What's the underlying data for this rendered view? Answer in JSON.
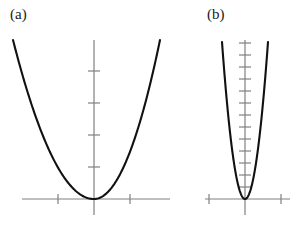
{
  "figure": {
    "background_color": "#ffffff",
    "axis_color": "#808080",
    "curve_color": "#111111",
    "label_color": "#1a1a1a",
    "axis_line_width": 1.2,
    "curve_line_width": 2.1,
    "tick_line_width": 1.2,
    "width": 295,
    "height": 232
  },
  "panels": [
    {
      "id": "a",
      "label": "(a)",
      "label_x": 10,
      "label_y": 6
    },
    {
      "id": "b",
      "label": "(b)",
      "label_x": 207,
      "label_y": 6
    }
  ],
  "chart_data": [
    {
      "type": "line",
      "id": "panel-a",
      "title": "(a)",
      "xlabel": "",
      "ylabel": "",
      "grid": false,
      "legend": "none",
      "description": "Wide upward-opening parabola y = a*x^2 with small leading coefficient, vertex at origin",
      "function": "y = 0.25 * x^2",
      "coefficient": 0.25,
      "origin_px": {
        "x": 94,
        "y": 199
      },
      "xlim": [
        -9,
        9
      ],
      "ylim": [
        -1,
        20
      ],
      "x_axis_px": {
        "x1": 22,
        "x2": 170,
        "y": 199
      },
      "y_axis_px": {
        "x": 94,
        "y1": 40,
        "y2": 215
      },
      "x_tick_spacing_px": 36,
      "x_ticks_px": [
        58,
        130
      ],
      "x_tick_half_len_px": 5,
      "y_tick_spacing_px": 32,
      "y_ticks_px": [
        167,
        135,
        103,
        71
      ],
      "y_tick_half_len_px": 6,
      "x": [
        -8.8,
        -8,
        -7,
        -6,
        -5,
        -4,
        -3,
        -2,
        -1,
        0,
        1,
        2,
        3,
        4,
        5,
        6,
        7,
        8,
        8.8
      ],
      "y": [
        19.4,
        16.0,
        12.3,
        9.0,
        6.3,
        4.0,
        2.3,
        1.0,
        0.25,
        0,
        0.25,
        1.0,
        2.3,
        4.0,
        6.3,
        9.0,
        12.3,
        16.0,
        19.4
      ],
      "curve_px": {
        "x_start": 13,
        "y_start": 40,
        "x_end": 160,
        "y_end": 40,
        "vertex_x": 94,
        "vertex_y": 199
      }
    },
    {
      "type": "line",
      "id": "panel-b",
      "title": "(b)",
      "xlabel": "",
      "ylabel": "",
      "grid": false,
      "legend": "none",
      "description": "Narrow steep upward-opening parabola y = a*x^2 with large leading coefficient, vertex at origin",
      "function": "y = 3.0 * x^2",
      "coefficient": 3.0,
      "origin_px": {
        "x": 245,
        "y": 199
      },
      "xlim": [
        -2.5,
        2.5
      ],
      "ylim": [
        -1,
        13
      ],
      "x_axis_px": {
        "x1": 205,
        "x2": 290,
        "y": 199
      },
      "y_axis_px": {
        "x": 245,
        "y1": 40,
        "y2": 215
      },
      "x_tick_spacing_px": 36,
      "x_ticks_px": [
        209,
        281
      ],
      "x_tick_half_len_px": 5,
      "y_tick_spacing_px": 12,
      "y_ticks_px": [
        187,
        175,
        163,
        151,
        139,
        127,
        115,
        103,
        91,
        79,
        67,
        55,
        43
      ],
      "y_tick_half_len_px": 6,
      "x": [
        -2.1,
        -1.8,
        -1.5,
        -1.2,
        -0.9,
        -0.6,
        -0.3,
        0,
        0.3,
        0.6,
        0.9,
        1.2,
        1.5,
        1.8,
        2.1
      ],
      "y": [
        13.2,
        9.7,
        6.75,
        4.32,
        2.43,
        1.08,
        0.27,
        0,
        0.27,
        1.08,
        2.43,
        4.32,
        6.75,
        9.7,
        13.2
      ],
      "curve_px": {
        "x_start": 222,
        "y_start": 42,
        "x_end": 268,
        "y_end": 42,
        "vertex_x": 245,
        "vertex_y": 199
      }
    }
  ]
}
